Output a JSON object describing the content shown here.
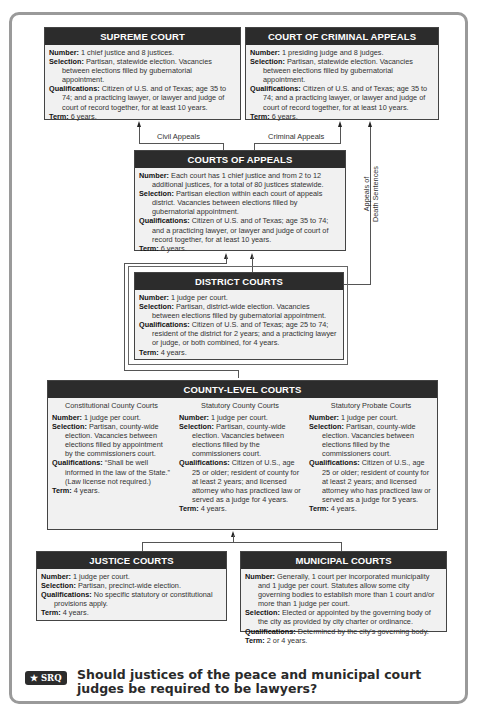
{
  "courts": {
    "supreme": {
      "title": "SUPREME COURT",
      "number_label": "Number:",
      "number": " 1 chief justice and 8 justices.",
      "selection_label": "Selection:",
      "selection": " Partisan, statewide election. Vacancies between elections filled by gubernatorial appointment.",
      "qualifications_label": "Qualifications:",
      "qualifications": " Citizen of U.S. and of Texas; age 35 to 74; and a practicing lawyer, or lawyer and judge of court of record together, for at least 10 years.",
      "term_label": "Term:",
      "term": " 6 years."
    },
    "criminal_appeals": {
      "title": "COURT OF CRIMINAL APPEALS",
      "number_label": "Number:",
      "number": " 1 presiding judge and 8 judges.",
      "selection_label": "Selection:",
      "selection": " Partisan, statewide election. Vacancies between elections filled by gubernatorial appointment.",
      "qualifications_label": "Qualifications:",
      "qualifications": " Citizen of U.S. and of Texas; age 35 to 74; and a practicing lawyer, or lawyer and judge of court of record together, for at least 10 years.",
      "term_label": "Term:",
      "term": " 6 years."
    },
    "appeals": {
      "title": "COURTS OF APPEALS",
      "number_label": "Number:",
      "number": " Each court has 1 chief justice and from 2 to 12 additional justices, for a total of 80 justices statewide.",
      "selection_label": "Selection:",
      "selection": " Partisan election within each court of appeals district. Vacancies between elections filled by gubernatorial appointment.",
      "qualifications_label": "Qualifications:",
      "qualifications": " Citizen of U.S. and of Texas; age 35 to 74; and a practicing lawyer, or lawyer and judge of court of record together, for at least 10 years.",
      "term_label": "Term:",
      "term": " 6 years."
    },
    "district": {
      "title": "DISTRICT COURTS",
      "number_label": "Number:",
      "number": " 1 judge per court.",
      "selection_label": "Selection:",
      "selection": " Partisan, district-wide election. Vacancies between elections filled by gubernatorial appointment.",
      "qualifications_label": "Qualifications:",
      "qualifications": " Citizen of U.S. and of Texas; age 25 to 74; resident of the district for 2 years; and a practicing lawyer or judge, or both combined, for 4 years.",
      "term_label": "Term:",
      "term": " 4 years."
    },
    "county": {
      "title": "COUNTY-LEVEL COURTS",
      "columns": [
        {
          "subtitle": "Constitutional County Courts",
          "number_label": "Number:",
          "number": " 1 judge per court.",
          "selection_label": "Selection:",
          "selection": " Partisan, county-wide election. Vacancies between elections filled by appointment by the commissioners court.",
          "qualifications_label": "Qualifications:",
          "qualifications": " “Shall be well informed in the law of the State.” (Law license not required.)",
          "term_label": "Term:",
          "term": " 4 years."
        },
        {
          "subtitle": "Statutory County Courts",
          "number_label": "Number:",
          "number": " 1 judge per court.",
          "selection_label": "Selection:",
          "selection": " Partisan, county-wide election. Vacancies between elections filled by the commissioners court.",
          "qualifications_label": "Qualifications:",
          "qualifications": " Citizen of U.S., age 25 or older; resident of county for at least 2 years; and licensed attorney who has practiced law or served as a judge for 4 years.",
          "term_label": "Term:",
          "term": " 4 years."
        },
        {
          "subtitle": "Statutory Probate Courts",
          "number_label": "Number:",
          "number": " 1 judge per court.",
          "selection_label": "Selection:",
          "selection": " Partisan, county-wide election. Vacancies between elections filled by the commissioners court.",
          "qualifications_label": "Qualifications:",
          "qualifications": " Citizen of U.S., age 25 or older; resident of county for at least 2 years; and licensed attorney who has practiced law or served as a judge for 5 years.",
          "term_label": "Term:",
          "term": " 4 years."
        }
      ]
    },
    "justice": {
      "title": "JUSTICE COURTS",
      "number_label": "Number:",
      "number": " 1 judge per court.",
      "selection_label": "Selection:",
      "selection": " Partisan, precinct-wide election.",
      "qualifications_label": "Qualifications:",
      "qualifications": " No specific statutory or constitutional provisions apply.",
      "term_label": "Term:",
      "term": " 4 years."
    },
    "municipal": {
      "title": "MUNICIPAL COURTS",
      "number_label": "Number:",
      "number": " Generally, 1 court per incorporated municipality and 1 judge per court. Statutes allow some city governing bodies to establish more than 1 court and/or more than 1 judge per court.",
      "selection_label": "Selection:",
      "selection": " Elected or appointed by the governing body of the city as provided by city charter or ordinance.",
      "qualifications_label": "Qualifications:",
      "qualifications": " Determined by the city's governing body.",
      "term_label": "Term:",
      "term": " 2 or 4 years."
    }
  },
  "connectors": {
    "civil_appeals": "Civil Appeals",
    "criminal_appeals": "Criminal Appeals",
    "death_line1": "Appeals of",
    "death_line2": "Death Sentences"
  },
  "srq": {
    "badge": "★ SRQ",
    "question": "Should justices of the peace and municipal court judges be required to be lawyers?"
  }
}
